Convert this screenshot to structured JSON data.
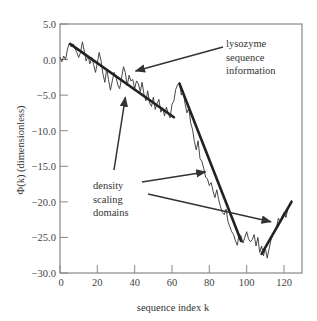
{
  "chart_data": {
    "type": "line",
    "title": "",
    "xlabel": "sequence index k",
    "ylabel": "Φ(k)  (dimensionless)",
    "xlim": [
      0,
      130
    ],
    "ylim": [
      -30,
      5
    ],
    "xticks": [
      0,
      20,
      40,
      60,
      80,
      100,
      120
    ],
    "xtick_labels": [
      "0",
      "20",
      "40",
      "60",
      "80",
      "100",
      "120"
    ],
    "yticks": [
      5,
      0,
      -5,
      -10,
      -15,
      -20,
      -25,
      -30
    ],
    "ytick_labels": [
      "5.0",
      "0.0",
      "−5.0",
      "−10.0",
      "−15.0",
      "−20.0",
      "−25.0",
      "−30.0"
    ],
    "grid": false,
    "legend": null,
    "series": [
      {
        "name": "lysozyme sequence information",
        "style": "thin",
        "x": [
          0,
          1,
          2,
          3,
          4,
          5,
          6,
          7,
          8,
          9,
          10,
          11,
          12,
          13,
          14,
          15,
          16,
          17,
          18,
          19,
          20,
          21,
          22,
          23,
          24,
          25,
          26,
          27,
          28,
          29,
          30,
          31,
          32,
          33,
          34,
          35,
          36,
          37,
          38,
          39,
          40,
          41,
          42,
          43,
          44,
          45,
          46,
          47,
          48,
          49,
          50,
          51,
          52,
          53,
          54,
          55,
          56,
          57,
          58,
          59,
          60,
          61,
          62,
          63,
          64,
          65,
          66,
          67,
          68,
          69,
          70,
          71,
          72,
          73,
          74,
          75,
          76,
          77,
          78,
          79,
          80,
          81,
          82,
          83,
          84,
          85,
          86,
          87,
          88,
          89,
          90,
          91,
          92,
          93,
          94,
          95,
          96,
          97,
          98,
          99,
          100,
          101,
          102,
          103,
          104,
          105,
          106,
          107,
          108,
          109,
          110,
          111,
          112,
          113,
          114,
          115,
          116,
          117,
          118,
          119,
          120,
          121,
          122,
          123,
          124
        ],
        "values": [
          0.3,
          -0.3,
          0.5,
          0.0,
          1.5,
          2.3,
          1.8,
          2.2,
          1.6,
          1.0,
          0.3,
          1.0,
          2.5,
          1.2,
          -0.2,
          0.5,
          -0.6,
          0.3,
          -0.7,
          -1.8,
          -0.5,
          1.0,
          -0.2,
          -2.0,
          -3.2,
          -1.3,
          -2.8,
          -4.3,
          -3.0,
          -1.8,
          -2.5,
          -3.6,
          -4.1,
          -2.5,
          -1.0,
          -1.8,
          -3.7,
          -2.2,
          -3.0,
          -2.8,
          -4.1,
          -3.0,
          -3.4,
          -4.5,
          -3.2,
          -4.9,
          -5.8,
          -4.4,
          -6.1,
          -6.6,
          -5.3,
          -7.0,
          -6.2,
          -5.6,
          -7.4,
          -6.8,
          -7.9,
          -6.7,
          -7.6,
          -8.2,
          -6.3,
          -5.8,
          -4.2,
          -3.5,
          -3.2,
          -5.0,
          -4.4,
          -6.2,
          -7.5,
          -6.8,
          -8.9,
          -9.8,
          -11.5,
          -12.7,
          -11.4,
          -13.9,
          -14.3,
          -15.3,
          -16.5,
          -16.8,
          -17.7,
          -17.3,
          -18.5,
          -19.4,
          -18.3,
          -19.7,
          -20.7,
          -21.5,
          -21.8,
          -21.0,
          -22.8,
          -23.5,
          -24.2,
          -24.6,
          -25.5,
          -26.1,
          -24.5,
          -24.8,
          -25.8,
          -25.0,
          -24.2,
          -25.2,
          -25.6,
          -25.3,
          -24.6,
          -26.2,
          -25.0,
          -27.1,
          -26.2,
          -27.6,
          -26.5,
          -27.9,
          -26.6,
          -25.4,
          -24.5,
          -24.0,
          -23.6,
          -22.3,
          -22.8,
          -22.0,
          -21.5,
          -22.2,
          -21.1,
          -20.5,
          -19.8
        ]
      },
      {
        "name": "density scaling domain 1 (fit)",
        "style": "thick",
        "x": [
          5.4,
          61
        ],
        "values": [
          2.2,
          -8.1
        ]
      },
      {
        "name": "density scaling domain 2 (fit)",
        "style": "thick",
        "x": [
          64,
          97
        ],
        "values": [
          -3.4,
          -25.5
        ]
      },
      {
        "name": "density scaling domain 3 (fit)",
        "style": "thick",
        "x": [
          108,
          124
        ],
        "values": [
          -27.3,
          -20.0
        ]
      }
    ],
    "annotations": [
      {
        "text": [
          "lysozyme",
          "sequence",
          "information"
        ],
        "arrow_to": {
          "k": 40.5,
          "phi": -1.6
        }
      },
      {
        "text": [
          "density",
          "scaling",
          "domains"
        ],
        "arrows_to": [
          {
            "k": 35,
            "phi": -5.3
          },
          {
            "k": 78,
            "phi": -15.8
          },
          {
            "k": 113,
            "phi": -22.8
          }
        ]
      }
    ]
  },
  "labels": {
    "xlabel": "sequence index k",
    "ylabel": "Φ(k)  (dimensionless)",
    "annot_lysozyme": [
      "lysozyme",
      "sequence",
      "information"
    ],
    "annot_density": [
      "density",
      "scaling",
      "domains"
    ],
    "xtick_labels": [
      "0",
      "20",
      "40",
      "60",
      "80",
      "100",
      "120"
    ],
    "ytick_labels": [
      "5.0",
      "0.0",
      "−5.0",
      "−10.0",
      "−15.0",
      "−20.0",
      "−25.0",
      "−30.0"
    ]
  },
  "colors": {
    "axis": "#888888",
    "line": "#333333",
    "fit": "#222222",
    "text": "#333333"
  }
}
